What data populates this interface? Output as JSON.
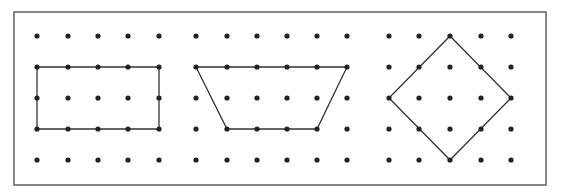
{
  "figure": {
    "frame": {
      "x": 14,
      "y": 12,
      "width": 532,
      "height": 173
    },
    "colors": {
      "background": "#ffffff",
      "frame": "#555555",
      "dot": "#222222",
      "line": "#333333"
    },
    "dot_radius": 2.6,
    "row_y": [
      36,
      67,
      98,
      129,
      160
    ],
    "grids": [
      {
        "name": "grid-left",
        "col_x": [
          37,
          68,
          98,
          128,
          159
        ],
        "shape": {
          "name": "rectangle",
          "type": "rectangle",
          "vertices_grid": [
            [
              0,
              1
            ],
            [
              4,
              1
            ],
            [
              4,
              3
            ],
            [
              0,
              3
            ]
          ]
        }
      },
      {
        "name": "grid-middle",
        "col_x": [
          196,
          227,
          257,
          287,
          317,
          347
        ],
        "shape": {
          "name": "trapezoid",
          "type": "trapezoid",
          "vertices_grid": [
            [
              0,
              1
            ],
            [
              5,
              1
            ],
            [
              4,
              3
            ],
            [
              1,
              3
            ]
          ]
        }
      },
      {
        "name": "grid-right",
        "col_x": [
          389,
          419,
          450,
          481,
          511
        ],
        "shape": {
          "name": "square-diamond",
          "type": "square (rotated 45°)",
          "vertices_grid": [
            [
              2,
              0
            ],
            [
              4,
              2
            ],
            [
              2,
              4
            ],
            [
              0,
              2
            ]
          ]
        }
      }
    ]
  }
}
